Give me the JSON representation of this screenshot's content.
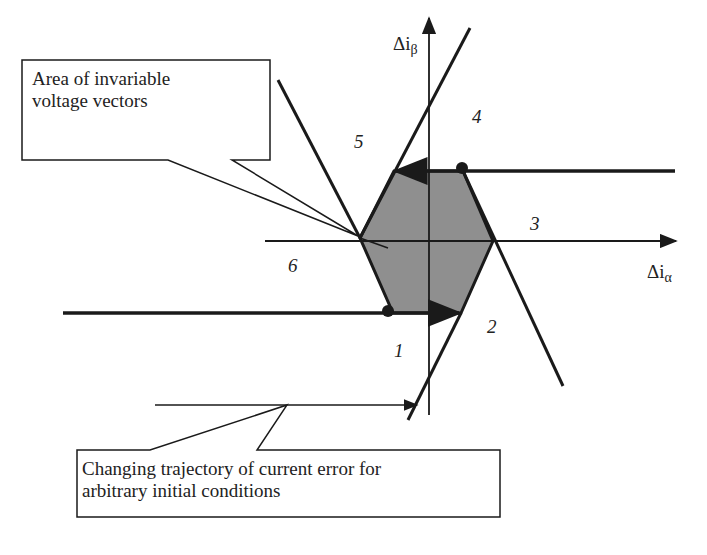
{
  "diagram": {
    "axes": {
      "x_label": "Δi",
      "x_subscript": "α",
      "y_label": "Δi",
      "y_subscript": "β"
    },
    "sector_numbers": [
      "1",
      "2",
      "3",
      "4",
      "5",
      "6"
    ],
    "callouts": {
      "top": {
        "line1": "Area of invariable",
        "line2": "voltage vectors"
      },
      "bottom": {
        "line1": "Changing trajectory of current error for",
        "line2": "arbitrary initial conditions"
      }
    },
    "colors": {
      "line": "#1a1a1a",
      "hexagon_fill": "#8f8f8f",
      "background": "#ffffff"
    }
  }
}
